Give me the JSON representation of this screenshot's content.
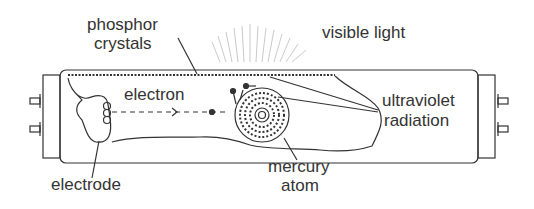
{
  "diagram": {
    "labels": {
      "phosphor_line1": "phosphor",
      "phosphor_line2": "crystals",
      "visible_light": "visible light",
      "electron": "electron",
      "ultraviolet_line1": "ultraviolet",
      "ultraviolet_line2": "radiation",
      "mercury_line1": "mercury",
      "mercury_line2": "atom",
      "electrode": "electrode"
    },
    "colors": {
      "ink": "#333333",
      "rays": "#bbbbbb",
      "background": "#ffffff"
    }
  }
}
